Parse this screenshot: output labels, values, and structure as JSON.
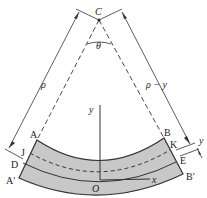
{
  "diagram": {
    "colors": {
      "beam_fill": "#c8c8c8",
      "stroke": "#333333",
      "background": "#ffffff"
    },
    "labels": {
      "center": "C",
      "angle": "θ",
      "radius": "ρ",
      "radius_minus_y": "ρ − y",
      "y_offset": "y",
      "y_axis": "y",
      "x_axis": "x",
      "origin": "O",
      "A": "A",
      "B": "B",
      "A_prime": "A′",
      "B_prime": "B′",
      "J": "J",
      "K": "K",
      "D": "D",
      "E": "E"
    }
  }
}
